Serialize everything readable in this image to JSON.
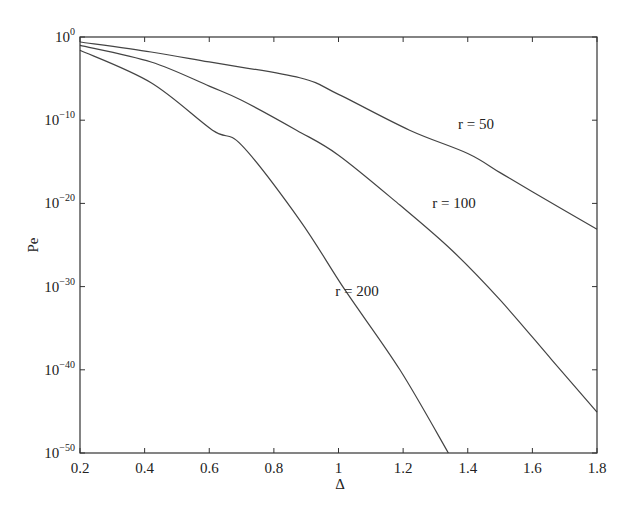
{
  "chart_data": {
    "type": "line",
    "title": "",
    "xlabel": "Δ",
    "ylabel": "Pe",
    "yscale": "log",
    "xlim": [
      0.2,
      1.8
    ],
    "ylim_log10": [
      -50,
      0
    ],
    "xticks": [
      "0.2",
      "0.4",
      "0.6",
      "0.8",
      "1",
      "1.2",
      "1.4",
      "1.6",
      "1.8"
    ],
    "yticks": [
      {
        "base": "10",
        "exp": "0"
      },
      {
        "base": "10",
        "exp": "−10"
      },
      {
        "base": "10",
        "exp": "−20"
      },
      {
        "base": "10",
        "exp": "−30"
      },
      {
        "base": "10",
        "exp": "−40"
      },
      {
        "base": "10",
        "exp": "−50"
      }
    ],
    "grid": false,
    "legend": "none (inline annotations)",
    "series": [
      {
        "name": "r = 50",
        "x": [
          0.2,
          0.42,
          0.6,
          0.88,
          1.0,
          1.22,
          1.4,
          1.5,
          1.6,
          1.8
        ],
        "log10y": [
          -0.6,
          -1.8,
          -3.0,
          -4.9,
          -6.9,
          -11.2,
          -14.0,
          -16.3,
          -18.6,
          -23.1
        ]
      },
      {
        "name": "r = 100",
        "x": [
          0.2,
          0.42,
          0.6,
          0.7,
          0.87,
          1.0,
          1.19,
          1.35,
          1.5,
          1.66,
          1.8
        ],
        "log10y": [
          -1.0,
          -3.0,
          -5.9,
          -7.6,
          -11.2,
          -14.2,
          -20.2,
          -25.6,
          -31.6,
          -38.8,
          -45.1
        ]
      },
      {
        "name": "r = 200",
        "x": [
          0.2,
          0.42,
          0.61,
          0.7,
          0.88,
          1.02,
          1.19,
          1.34
        ],
        "log10y": [
          -1.6,
          -5.5,
          -11.2,
          -13.0,
          -22.0,
          -30.4,
          -40.0,
          -50.0
        ]
      }
    ],
    "annotations": [
      {
        "text": "r = 50",
        "x": 1.37,
        "log10y": -10.5
      },
      {
        "text": "r = 100",
        "x": 1.29,
        "log10y": -20.0
      },
      {
        "text": "r = 200",
        "x": 0.99,
        "log10y": -30.5
      }
    ]
  }
}
